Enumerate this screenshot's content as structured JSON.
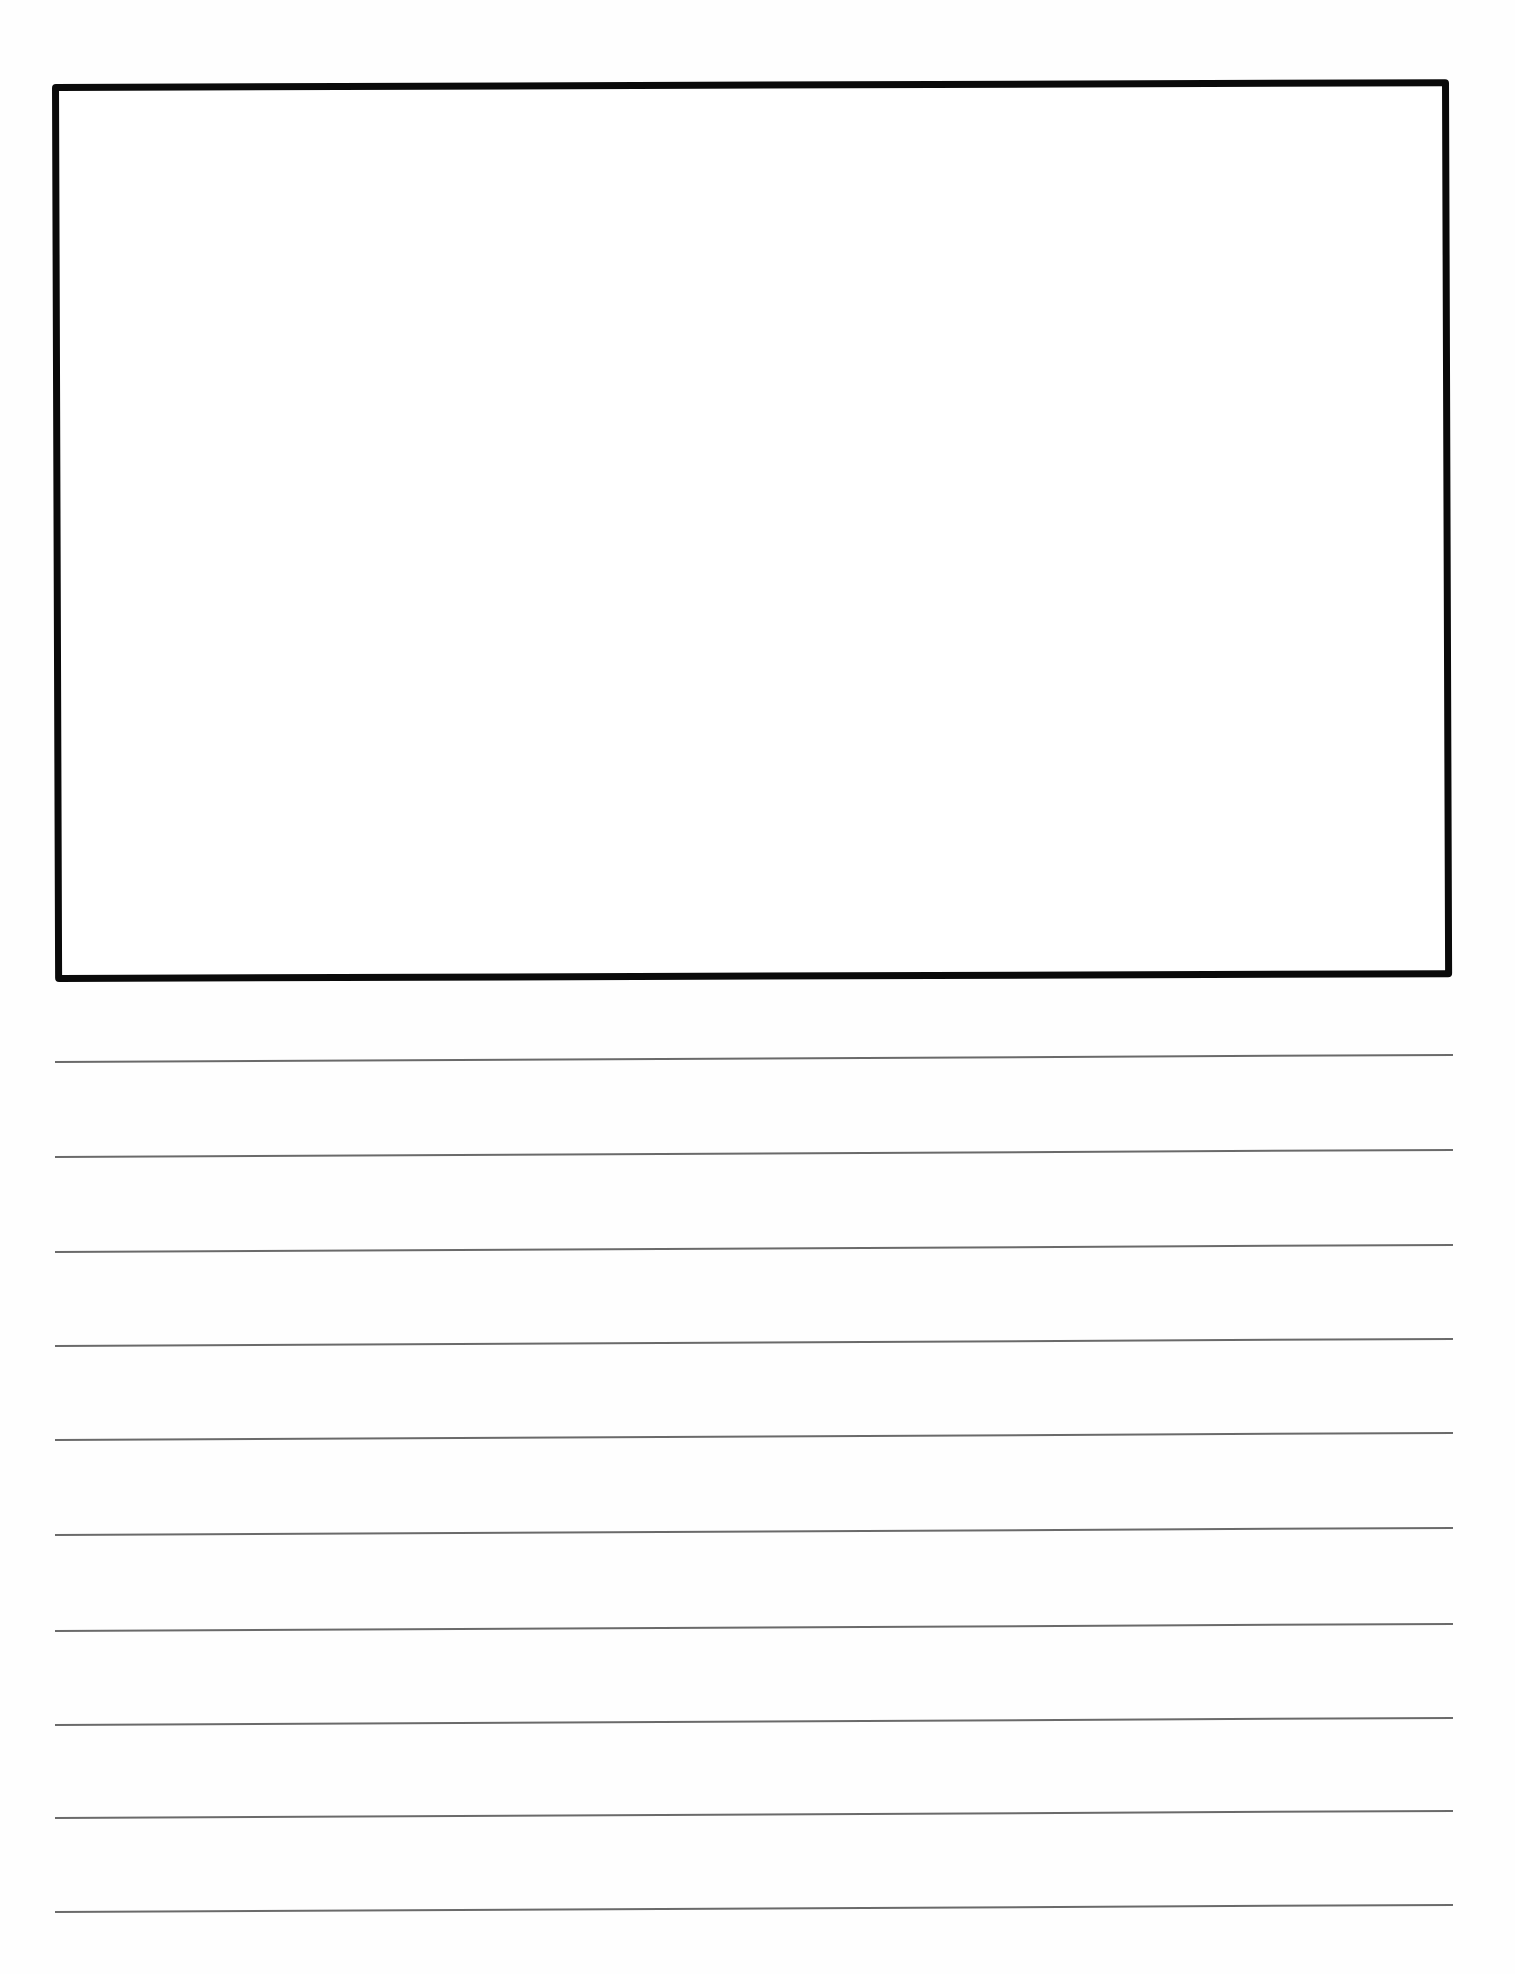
{
  "document": {
    "type": "primary writing paper",
    "drawing_box": {
      "border_color": "#0a0a0a",
      "content": ""
    },
    "ruled_lines": {
      "count": 10,
      "color": "#6a6a6a",
      "positions_y": [
        1062,
        1157,
        1252,
        1346,
        1440,
        1535,
        1630,
        1725,
        1818,
        1912
      ],
      "text": [
        "",
        "",
        "",
        "",
        "",
        "",
        "",
        "",
        "",
        ""
      ]
    }
  }
}
